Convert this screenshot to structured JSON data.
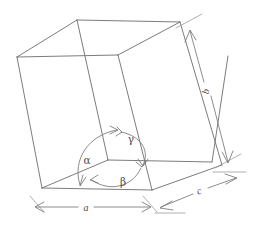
{
  "figure": {
    "type": "line-diagram",
    "width": 269,
    "height": 226,
    "background_color": "#ffffff",
    "line_color": "#6d6d70",
    "annotation_color": "#77777a",
    "label_color": "#4a4a4d"
  },
  "labels": {
    "edge_a": "a",
    "edge_b": "b",
    "edge_c": "c",
    "angle_alpha": "α",
    "angle_beta": "β",
    "angle_gamma": "γ"
  },
  "geometry": {
    "origin_vertex": "bottom-front-left-inner",
    "vertices": {
      "top_back_left": [
        17,
        57
      ],
      "top_back_top": [
        77,
        20
      ],
      "top_front_inner": [
        118,
        55
      ],
      "top_right": [
        180,
        22
      ],
      "bottom_left": [
        42,
        188
      ],
      "bottom_origin": [
        118,
        163
      ],
      "bottom_front": [
        152,
        190
      ],
      "bottom_right": [
        222,
        165
      ],
      "right_upper": [
        228,
        56
      ]
    }
  },
  "dimensions": [
    {
      "name": "a",
      "label": "a",
      "orientation": "horizontal",
      "position": "bottom",
      "arrow_style": "double-headed",
      "from": [
        35,
        207
      ],
      "to": [
        150,
        207
      ]
    },
    {
      "name": "b",
      "label": "b",
      "orientation": "vertical-oblique",
      "position": "right",
      "arrow_style": "double-headed",
      "from": [
        190,
        30
      ],
      "to": [
        228,
        163
      ]
    },
    {
      "name": "c",
      "label": "c",
      "orientation": "oblique",
      "position": "bottom-right",
      "arrow_style": "double-headed",
      "from": [
        160,
        208
      ],
      "to": [
        235,
        180
      ]
    }
  ],
  "angles": [
    {
      "name": "alpha",
      "label": "α",
      "label_position": [
        87,
        160
      ],
      "between_edges": [
        "b",
        "c"
      ],
      "arc_from_vertex": [
        118,
        163
      ]
    },
    {
      "name": "beta",
      "label": "β",
      "label_position": [
        123,
        182
      ],
      "between_edges": [
        "a",
        "c"
      ],
      "arc_from_vertex": [
        118,
        163
      ]
    },
    {
      "name": "gamma",
      "label": "γ",
      "label_position": [
        130,
        139
      ],
      "between_edges": [
        "a",
        "b"
      ],
      "arc_from_vertex": [
        118,
        163
      ]
    }
  ]
}
